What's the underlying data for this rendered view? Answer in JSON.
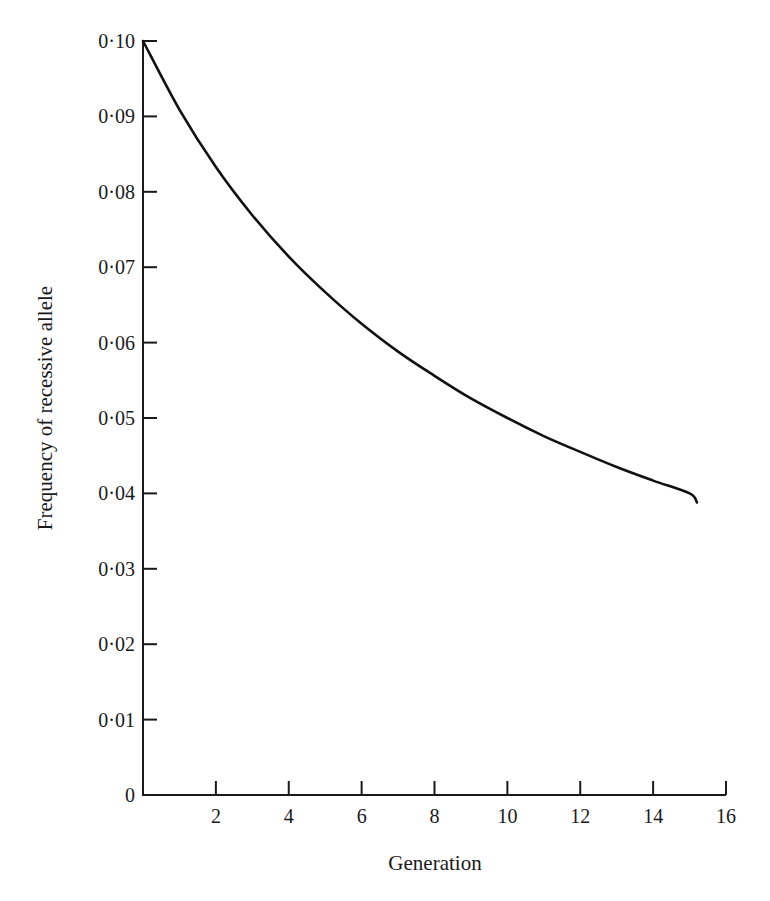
{
  "chart_data": {
    "type": "line",
    "title": "",
    "xlabel": "Generation",
    "ylabel": "Frequency of recessive allele",
    "xlim": [
      0,
      16
    ],
    "ylim": [
      0,
      0.1
    ],
    "grid": false,
    "legend": null,
    "x_ticks": [
      2,
      4,
      6,
      8,
      10,
      12,
      14,
      16
    ],
    "x_tick_labels": [
      "2",
      "4",
      "6",
      "8",
      "10",
      "12",
      "14",
      "16"
    ],
    "y_ticks": [
      0,
      0.01,
      0.02,
      0.03,
      0.04,
      0.05,
      0.06,
      0.07,
      0.08,
      0.09,
      0.1
    ],
    "y_tick_labels": [
      "0",
      "0·01",
      "0·02",
      "0·03",
      "0·04",
      "0·05",
      "0·06",
      "0·07",
      "0·08",
      "0·09",
      "0·10"
    ],
    "series": [
      {
        "name": "Frequency of recessive allele",
        "x": [
          0,
          1,
          2,
          3,
          4,
          5,
          6,
          7,
          8,
          9,
          10,
          11,
          12,
          13,
          14,
          15,
          15.2
        ],
        "values": [
          0.1,
          0.0909,
          0.0833,
          0.0769,
          0.0714,
          0.0667,
          0.0625,
          0.0588,
          0.0556,
          0.0526,
          0.05,
          0.0476,
          0.0455,
          0.0435,
          0.0417,
          0.04,
          0.0388
        ]
      }
    ]
  },
  "style": {
    "line_color": "#111111",
    "axis_color": "#1a1a1a",
    "background": "#ffffff"
  }
}
